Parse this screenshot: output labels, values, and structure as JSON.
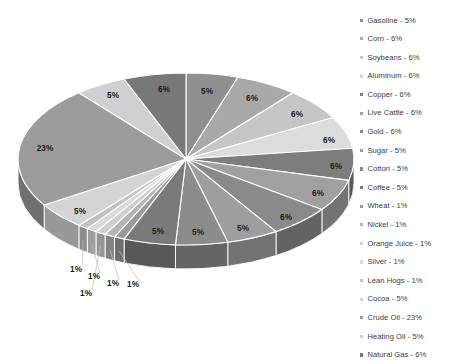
{
  "chart_data": {
    "type": "pie",
    "title": "",
    "legend_position": "right",
    "three_d": true,
    "categories": [
      "Gasoline",
      "Corn",
      "Soybeans",
      "Aluminum",
      "Copper",
      "Live Cattle",
      "Gold",
      "Sugar",
      "Cotton",
      "Coffee",
      "Wheat",
      "Nickel",
      "Orange Juice",
      "Silver",
      "Lean Hogs",
      "Cocoa",
      "Crude Oil",
      "Heating Oil",
      "Natural Gas"
    ],
    "values": [
      5,
      6,
      6,
      6,
      6,
      6,
      6,
      5,
      5,
      5,
      1,
      1,
      1,
      1,
      1,
      5,
      23,
      5,
      6
    ],
    "unit": "%",
    "slices": [
      {
        "name": "Gasoline",
        "value": 5,
        "label": "5%",
        "color": "#8f8f8f",
        "label_x": 207,
        "label_y": 92
      },
      {
        "name": "Corn",
        "value": 6,
        "label": "6%",
        "color": "#a9a9a9",
        "label_x": 252,
        "label_y": 99
      },
      {
        "name": "Soybeans",
        "value": 6,
        "label": "6%",
        "color": "#c6c6c6",
        "label_x": 297,
        "label_y": 115
      },
      {
        "name": "Aluminum",
        "value": 6,
        "label": "6%",
        "color": "#dcdcdc",
        "label_x": 329,
        "label_y": 141
      },
      {
        "name": "Copper",
        "value": 6,
        "label": "6%",
        "color": "#7d7d7d",
        "label_x": 336,
        "label_y": 167
      },
      {
        "name": "Live Cattle",
        "value": 6,
        "label": "6%",
        "color": "#a0a0a0",
        "label_x": 318,
        "label_y": 194
      },
      {
        "name": "Gold",
        "value": 6,
        "label": "6%",
        "color": "#8a8a8a",
        "label_x": 286,
        "label_y": 218
      },
      {
        "name": "Sugar",
        "value": 5,
        "label": "5%",
        "color": "#9e9e9e",
        "label_x": 243,
        "label_y": 229
      },
      {
        "name": "Cotton",
        "value": 5,
        "label": "5%",
        "color": "#8c8c8c",
        "label_x": 198,
        "label_y": 233
      },
      {
        "name": "Coffee",
        "value": 5,
        "label": "5%",
        "color": "#7a7a7a",
        "label_x": 158,
        "label_y": 232
      },
      {
        "name": "Wheat",
        "value": 1,
        "label": "1%",
        "color": "#9a9a9a",
        "label_x": 133,
        "label_y": 285
      },
      {
        "name": "Nickel",
        "value": 1,
        "label": "1%",
        "color": "#b5b5b5",
        "label_x": 113,
        "label_y": 284
      },
      {
        "name": "Orange Juice",
        "value": 1,
        "label": "1%",
        "color": "#cfcfcf",
        "label_x": 86,
        "label_y": 294
      },
      {
        "name": "Silver",
        "value": 1,
        "label": "1%",
        "color": "#dadada",
        "label_x": 94,
        "label_y": 277
      },
      {
        "name": "Lean Hogs",
        "value": 1,
        "label": "1%",
        "color": "#c2c2c2",
        "label_x": 76,
        "label_y": 270
      },
      {
        "name": "Cocoa",
        "value": 5,
        "label": "5%",
        "color": "#d4d4d4",
        "label_x": 80,
        "label_y": 212
      },
      {
        "name": "Crude Oil",
        "value": 23,
        "label": "23%",
        "color": "#9c9c9c",
        "label_x": 45,
        "label_y": 149
      },
      {
        "name": "Heating Oil",
        "value": 5,
        "label": "5%",
        "color": "#d0d0d0",
        "label_x": 113,
        "label_y": 96
      },
      {
        "name": "Natural Gas",
        "value": 6,
        "label": "6%",
        "color": "#787878",
        "label_x": 164,
        "label_y": 90
      }
    ]
  },
  "legend": {
    "items": [
      {
        "label": "Gasoline - 5%",
        "color": "#8f8f8f"
      },
      {
        "label": "Corn - 6%",
        "color": "#a9a9a9"
      },
      {
        "label": "Soybeans - 6%",
        "color": "#c6c6c6"
      },
      {
        "label": "Aluminum - 6%",
        "color": "#dcdcdc"
      },
      {
        "label": "Copper - 6%",
        "color": "#7d7d7d"
      },
      {
        "label": "Live Cattle - 6%",
        "color": "#a0a0a0"
      },
      {
        "label": "Gold - 6%",
        "color": "#8a8a8a"
      },
      {
        "label": "Sugar - 5%",
        "color": "#9e9e9e"
      },
      {
        "label": "Cotton - 5%",
        "color": "#8c8c8c"
      },
      {
        "label": "Coffee - 5%",
        "color": "#7a7a7a"
      },
      {
        "label": "Wheat - 1%",
        "color": "#9a9a9a"
      },
      {
        "label": "Nickel - 1%",
        "color": "#b5b5b5"
      },
      {
        "label": "Orange Juice - 1%",
        "color": "#cfcfcf"
      },
      {
        "label": "Silver - 1%",
        "color": "#dadada"
      },
      {
        "label": "Lean Hogs - 1%",
        "color": "#c2c2c2"
      },
      {
        "label": "Cocoa - 5%",
        "color": "#d4d4d4"
      },
      {
        "label": "Crude Oil - 23%",
        "color": "#9c9c9c"
      },
      {
        "label": "Heating Oil - 5%",
        "color": "#d0d0d0"
      },
      {
        "label": "Natural Gas - 6%",
        "color": "#787878"
      }
    ]
  },
  "geometry": {
    "cx": 186,
    "cy": 159,
    "rx": 168,
    "ry": 86,
    "depth": 24,
    "start_angle_deg": -90
  }
}
